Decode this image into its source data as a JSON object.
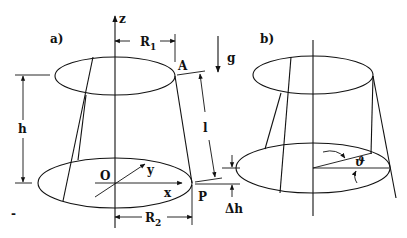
{
  "figure": {
    "panel_a": {
      "label": "a)",
      "axis_z": "z",
      "axis_x": "x",
      "axis_y": "y",
      "origin": "O",
      "point_top": "A",
      "point_bottom": "P",
      "gravity": "g",
      "height": "h",
      "slant_length": "l",
      "delta_h": "Δh",
      "r1_main": "R",
      "r1_sub": "1",
      "r2_main": "R",
      "r2_sub": "2"
    },
    "panel_b": {
      "label": "b)",
      "angle": "ϑ"
    },
    "stray_mark": "-"
  }
}
